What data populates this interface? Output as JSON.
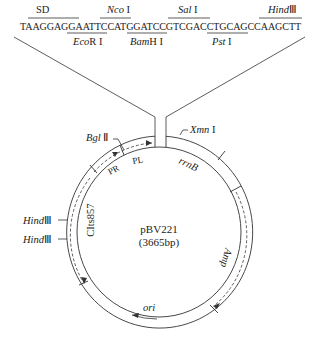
{
  "sequence": {
    "text": "TAAGGAGGAATTCCATGGATCCGTCGACCTGCAGCCAAGCTT",
    "above_labels": [
      {
        "name": "SD",
        "italic": "",
        "suffix": "SD"
      },
      {
        "name": "Nco I",
        "italic": "Nco",
        "suffix": " I"
      },
      {
        "name": "Sal I",
        "italic": "Sal",
        "suffix": " I"
      },
      {
        "name": "HindIII",
        "italic": "Hind",
        "suffix": "Ⅲ"
      }
    ],
    "below_labels": [
      {
        "name": "EcoR I",
        "italic": "Eco",
        "suffix": "R I"
      },
      {
        "name": "BamH I",
        "italic": "Bam",
        "suffix": "H I"
      },
      {
        "name": "Pst I",
        "italic": "Pst",
        "suffix": " I"
      }
    ]
  },
  "plasmid": {
    "name": "pBV221",
    "size": "(3665bp)",
    "features": {
      "bglII": {
        "italic": "Bgl",
        "suffix": " Ⅱ"
      },
      "xmnI": {
        "italic": "Xmn",
        "suffix": " I"
      },
      "hind1": {
        "italic": "Hind",
        "suffix": "Ⅲ"
      },
      "hind2": {
        "italic": "Hind",
        "suffix": "Ⅲ"
      },
      "pr": "PR",
      "pl": "PL",
      "rrnB": "rrnB",
      "clts857": "CIts857",
      "amp": "Amp",
      "ori": "ori"
    }
  }
}
